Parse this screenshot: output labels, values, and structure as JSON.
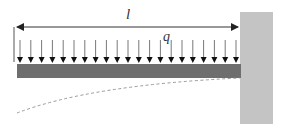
{
  "diagram": {
    "labels": {
      "length": "l",
      "load": "q"
    },
    "colors": {
      "beam": "#6e6e6e",
      "wall": "#c4c4c4",
      "arrow": "#1a1a1a",
      "dimension": "#333333",
      "deflection": "#9a9a9a"
    },
    "arrow_count": 21,
    "elements": [
      "dimension-line-l",
      "distributed-load-q",
      "beam",
      "fixed-wall-support",
      "deflection-curve"
    ]
  }
}
